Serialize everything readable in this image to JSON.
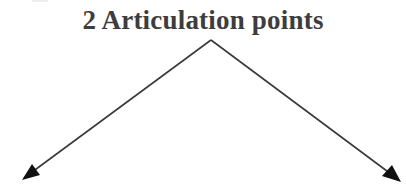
{
  "diagram": {
    "title": "2 Articulation points",
    "colors": {
      "text": "#3d3d3d",
      "line": "#3a3a3a",
      "arrowhead": "#111111",
      "background": "#ffffff"
    },
    "apex": {
      "x": 211,
      "y": 40
    },
    "arrows": [
      {
        "name": "left-arrow",
        "from": {
          "x": 211,
          "y": 40
        },
        "to": {
          "x": 22,
          "y": 180
        }
      },
      {
        "name": "right-arrow",
        "from": {
          "x": 211,
          "y": 40
        },
        "to": {
          "x": 401,
          "y": 182
        }
      }
    ]
  }
}
